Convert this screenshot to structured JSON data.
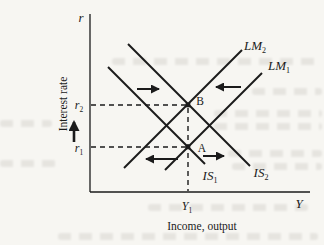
{
  "colors": {
    "paper": "#f7f6f2",
    "ink": "#1b1b1b"
  },
  "axis": {
    "y_symbol": "r",
    "y_label": "Interest rate",
    "x_symbol": "Y",
    "x_label": "Income, output"
  },
  "ticks": {
    "r2": {
      "main": "r",
      "sub": "2"
    },
    "r1": {
      "main": "r",
      "sub": "1"
    },
    "y1": {
      "main": "Y",
      "sub": "1"
    }
  },
  "curves": {
    "lm2": {
      "main": "LM",
      "sub": "2"
    },
    "lm1": {
      "main": "LM",
      "sub": "1"
    },
    "is1": {
      "main": "IS",
      "sub": "1"
    },
    "is2": {
      "main": "IS",
      "sub": "2"
    }
  },
  "points": {
    "b": "B",
    "a": "A"
  },
  "arrows": {
    "is_shift_upper": "right",
    "lm_shift_upper": "left",
    "lm_shift_lower": "left",
    "is_shift_lower": "right",
    "interest_rate": "up"
  }
}
